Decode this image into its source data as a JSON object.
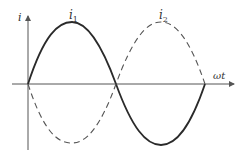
{
  "diagram": {
    "type": "waveform",
    "y_axis_label": "i",
    "x_axis_label": "ωt",
    "curves": [
      {
        "name": "i1",
        "label_main": "i",
        "label_sub": "1",
        "style": "solid",
        "phase": "sin(ωt)"
      },
      {
        "name": "i2",
        "label_main": "i",
        "label_sub": "2",
        "style": "dashed",
        "phase": "-sin(ωt)"
      }
    ],
    "colors": {
      "line": "#2a2a2a",
      "axis": "#555555",
      "background": "#ffffff"
    }
  }
}
